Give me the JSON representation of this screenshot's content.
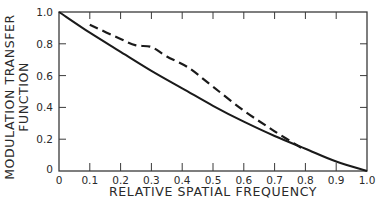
{
  "chart_data": {
    "type": "line",
    "title": "",
    "xlabel": "RELATIVE SPATIAL FREQUENCY",
    "ylabel_lines": [
      "MODULATION TRANSFER",
      "FUNCTION"
    ],
    "ylabel": "MODULATION TRANSFER FUNCTION",
    "xlim": [
      0,
      1.0
    ],
    "ylim": [
      0,
      1.0
    ],
    "x_ticks": [
      0,
      0.1,
      0.2,
      0.3,
      0.4,
      0.5,
      0.6,
      0.7,
      0.8,
      0.9,
      1.0
    ],
    "x_tick_labels": [
      "0",
      "0.1",
      "0.2",
      "0.3",
      "0.4",
      "0.5",
      "0.6",
      "0.7",
      "0.8",
      "0.9",
      "1.0"
    ],
    "y_ticks": [
      0,
      0.2,
      0.4,
      0.6,
      0.8,
      1.0
    ],
    "y_tick_labels": [
      "0",
      "0.2",
      "0.4",
      "0.6",
      "0.8",
      "1.0"
    ],
    "grid": false,
    "legend": null,
    "ticks_direction": "inward",
    "frame": "box",
    "series": [
      {
        "name": "solid",
        "style": "solid",
        "color": "#1a1a1a",
        "x": [
          0,
          0.1,
          0.2,
          0.3,
          0.4,
          0.5,
          0.6,
          0.7,
          0.8,
          0.9,
          1.0
        ],
        "values": [
          1.0,
          0.87,
          0.75,
          0.63,
          0.52,
          0.41,
          0.31,
          0.22,
          0.14,
          0.06,
          0.0
        ]
      },
      {
        "name": "dashed",
        "style": "dashed",
        "color": "#1a1a1a",
        "x": [
          0.1,
          0.2,
          0.25,
          0.3,
          0.35,
          0.42,
          0.5,
          0.6,
          0.7,
          0.8
        ],
        "values": [
          0.92,
          0.83,
          0.79,
          0.78,
          0.72,
          0.65,
          0.53,
          0.38,
          0.25,
          0.13
        ]
      }
    ]
  },
  "style": {
    "ink": "#1a1a1a",
    "background": "#ffffff"
  }
}
